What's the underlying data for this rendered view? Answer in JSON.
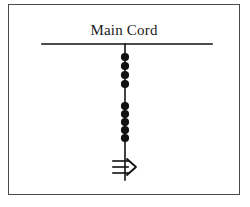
{
  "figure": {
    "title": "Main Cord",
    "background_color": "#ffffff",
    "border_color": "#4a4a4a",
    "ink_color": "#111111",
    "frame": {
      "x": 8,
      "y": 4,
      "width": 232,
      "height": 191
    }
  },
  "main_cord": {
    "label": "Main Cord",
    "orientation": "horizontal",
    "x_start": 42,
    "x_end": 212,
    "y": 44,
    "stroke_width": 1.6
  },
  "branch": {
    "name": "vertical-branch",
    "orientation": "vertical",
    "x": 125,
    "y_start": 44,
    "y_end": 180,
    "stroke_width": 1.6
  },
  "node_groups": [
    {
      "name": "upper-node-cluster",
      "count": 4,
      "radius": 4.1,
      "color": "#111111",
      "cx": 125,
      "cy_values": [
        57,
        66,
        75,
        84
      ]
    },
    {
      "name": "lower-node-cluster",
      "count": 5,
      "radius": 4.1,
      "color": "#111111",
      "cx": 125,
      "cy_values": [
        106,
        114,
        122,
        130,
        138
      ]
    }
  ],
  "terminal_symbol": {
    "name": "terminal-ground-arrow",
    "cx": 125,
    "cy": 167,
    "tick_count": 3,
    "tick_y_values": [
      161,
      167,
      173
    ],
    "tick_x_start": 113,
    "tick_x_end": 128,
    "arrow_points": "127,159 136,167 127,175",
    "color": "#111111"
  }
}
